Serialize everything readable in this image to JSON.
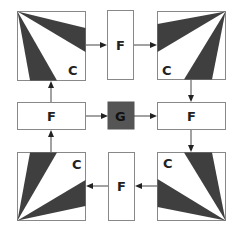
{
  "diagram": {
    "colors": {
      "wedge": "#3f3f3f",
      "g_fill": "#555555",
      "border": "#888888",
      "arrow": "#222222"
    },
    "nodes": {
      "c_top_left": {
        "label": "C"
      },
      "f_top": {
        "label": "F"
      },
      "c_top_right": {
        "label": "C"
      },
      "f_mid_left": {
        "label": "F"
      },
      "g_center": {
        "label": "G"
      },
      "f_mid_right": {
        "label": "F"
      },
      "c_bottom_left": {
        "label": "C"
      },
      "f_bottom": {
        "label": "F"
      },
      "c_bottom_right": {
        "label": "C"
      }
    },
    "edges": [
      {
        "from": "c_top_left",
        "to": "f_top"
      },
      {
        "from": "f_top",
        "to": "c_top_right"
      },
      {
        "from": "c_top_right",
        "to": "f_mid_right"
      },
      {
        "from": "f_mid_right",
        "to": "c_bottom_right"
      },
      {
        "from": "c_bottom_right",
        "to": "f_bottom"
      },
      {
        "from": "f_bottom",
        "to": "c_bottom_left"
      },
      {
        "from": "c_bottom_left",
        "to": "f_mid_left"
      },
      {
        "from": "f_mid_left",
        "to": "c_top_left"
      },
      {
        "from": "f_mid_left",
        "to": "g_center"
      },
      {
        "from": "g_center",
        "to": "f_mid_right"
      }
    ]
  }
}
